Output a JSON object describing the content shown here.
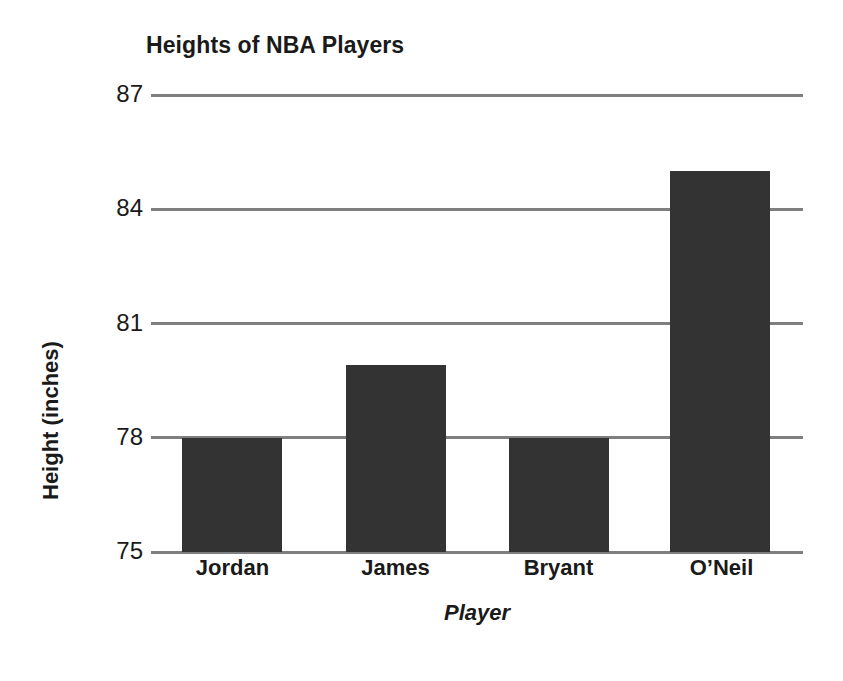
{
  "chart_data": {
    "type": "bar",
    "title": "Heights of NBA Players",
    "xlabel": "Player",
    "ylabel": "Height (inches)",
    "categories": [
      "Jordan",
      "James",
      "Bryant",
      "O’Neil"
    ],
    "values": [
      78,
      79.9,
      78,
      85
    ],
    "ylim": [
      75,
      87
    ],
    "yticks": [
      75,
      78,
      81,
      84,
      87
    ],
    "ytick_labels": [
      "75",
      "78",
      "81",
      "84",
      "87"
    ],
    "grid": true,
    "legend": false,
    "bar_color": "#333333",
    "gridline_color": "#7f7f7f",
    "background_color": "#ffffff",
    "text_color": "#1a1a1a"
  }
}
